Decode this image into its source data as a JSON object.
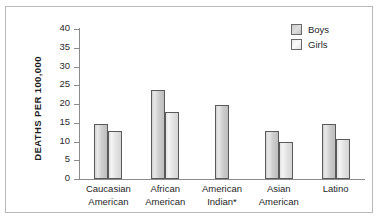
{
  "chart_data": {
    "type": "bar",
    "title": "",
    "xlabel": "",
    "ylabel": "DEATHS PER 100,000",
    "ylim": [
      0,
      40
    ],
    "ytick_step": 5,
    "yticks": [
      40,
      35,
      30,
      25,
      20,
      15,
      10,
      5,
      0
    ],
    "grid": false,
    "legend_position": "top-right",
    "categories": [
      "Caucasian\nAmerican",
      "African\nAmerican",
      "American\nIndian*",
      "Asian\nAmerican",
      "Latino"
    ],
    "category_lines": [
      [
        "Caucasian",
        "American"
      ],
      [
        "African",
        "American"
      ],
      [
        "American",
        "Indian*"
      ],
      [
        "Asian",
        "American"
      ],
      [
        "Latino",
        ""
      ]
    ],
    "series": [
      {
        "name": "Boys",
        "values": [
          14.8,
          23.8,
          19.8,
          12.8,
          14.8
        ]
      },
      {
        "name": "Girls",
        "values": [
          12.8,
          17.8,
          null,
          9.8,
          10.7
        ]
      }
    ]
  },
  "legend": {
    "items": [
      {
        "label": "Boys",
        "swatch": "boys"
      },
      {
        "label": "Girls",
        "swatch": "girls"
      }
    ]
  },
  "colors": {
    "bar_boys_fill": "#cfcfcf",
    "bar_girls_fill": "#e8e8e8",
    "bar_outline": "#5a5a5a",
    "axis": "#8c8c8c",
    "frame": "#b9b9b9",
    "text": "#1f1f1f",
    "background": "#ffffff"
  }
}
